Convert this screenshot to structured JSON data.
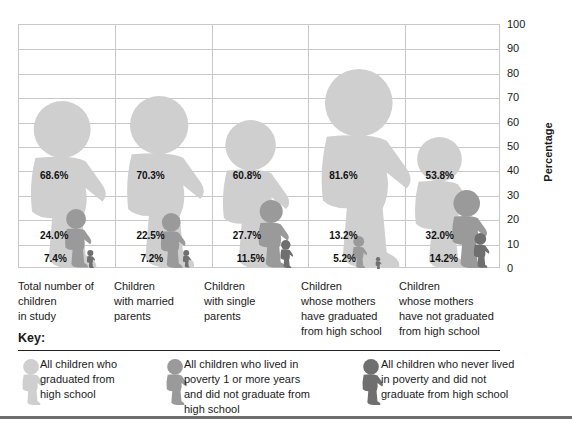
{
  "chart_data": {
    "type": "bar",
    "title": "",
    "xlabel": "",
    "ylabel": "Percentage",
    "ylim": [
      0,
      100
    ],
    "yticks": [
      0,
      10,
      20,
      30,
      40,
      50,
      60,
      70,
      80,
      90,
      100
    ],
    "grid": true,
    "legend_position": "bottom",
    "categories": [
      "Total number of children in study",
      "Children with married parents",
      "Children with single parents",
      "Children whose mothers have graduated from high school",
      "Children whose mothers have not graduated from high school"
    ],
    "series": [
      {
        "name": "All children who graduated from high school",
        "color": "#cfcfcf",
        "values": [
          68.6,
          70.3,
          60.8,
          81.6,
          53.8
        ]
      },
      {
        "name": "All children who lived in poverty 1 or more years and did not graduate from high school",
        "color": "#9a9a9a",
        "values": [
          24.0,
          22.5,
          27.7,
          13.2,
          32.0
        ]
      },
      {
        "name": "All children who never lived in poverty and did not graduate from high school",
        "color": "#6f6f6f",
        "values": [
          7.4,
          7.2,
          11.5,
          5.2,
          14.2
        ]
      }
    ]
  },
  "axis": {
    "ylabel": "Percentage",
    "ticks": [
      "100",
      "90",
      "80",
      "70",
      "60",
      "50",
      "40",
      "30",
      "20",
      "10",
      "0"
    ]
  },
  "labels": [
    [
      "68.6%",
      "24.0%",
      "7.4%"
    ],
    [
      "70.3%",
      "22.5%",
      "7.2%"
    ],
    [
      "60.8%",
      "27.7%",
      "11.5%"
    ],
    [
      "81.6%",
      "13.2%",
      "5.2%"
    ],
    [
      "53.8%",
      "32.0%",
      "14.2%"
    ]
  ],
  "categories": [
    "Total number of\nchildren\nin study",
    "Children\nwith married\nparents",
    "Children\nwith single\nparents",
    "Children\nwhose mothers\nhave graduated\nfrom high school",
    "Children\nwhose mothers\nhave not graduated\nfrom high school"
  ],
  "key": {
    "title": "Key:",
    "items": [
      {
        "label": "All children who\ngraduated from\nhigh school",
        "color": "#cfcfcf"
      },
      {
        "label": "All children who lived in\npoverty 1 or more years\nand did not graduate from\nhigh school",
        "color": "#9a9a9a"
      },
      {
        "label": "All children who never lived\nin poverty and did not\ngraduate from high school",
        "color": "#6f6f6f"
      }
    ]
  }
}
